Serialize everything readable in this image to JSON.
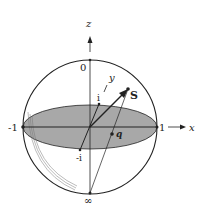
{
  "diagram": {
    "type": "riemann-sphere",
    "axes": {
      "z": "z",
      "x": "x",
      "y": "y"
    },
    "points": {
      "north": "0",
      "south": "∞",
      "left": "-1",
      "right": "1",
      "i": "i",
      "minus_i": "-i",
      "S": "S",
      "q": "q"
    },
    "colors": {
      "line": "#222222",
      "equatorial_fill": "#a8a8a8",
      "background": "#ffffff"
    }
  }
}
